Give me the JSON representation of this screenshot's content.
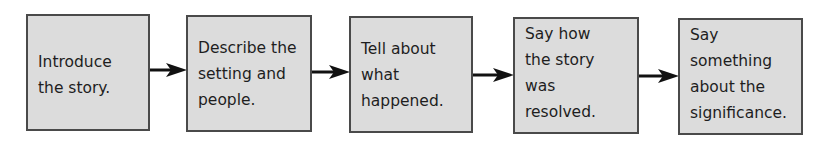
{
  "diagram": {
    "type": "flowchart",
    "direction": "left-to-right",
    "colors": {
      "box_fill": "#dcdcdc",
      "box_border": "#4a4a4a",
      "arrow": "#111111",
      "text": "#1e1e1e"
    },
    "steps": [
      {
        "lines": [
          "Introduce",
          "the story."
        ]
      },
      {
        "lines": [
          "Describe the",
          "setting and",
          "people."
        ]
      },
      {
        "lines": [
          "Tell about",
          "what",
          "happened."
        ]
      },
      {
        "lines": [
          "Say how",
          "the story",
          "was",
          "resolved."
        ]
      },
      {
        "lines": [
          "Say",
          "something",
          "about the",
          "significance."
        ]
      }
    ],
    "connectors": [
      {
        "from": 0,
        "to": 1
      },
      {
        "from": 1,
        "to": 2
      },
      {
        "from": 2,
        "to": 3
      },
      {
        "from": 3,
        "to": 4
      }
    ]
  }
}
